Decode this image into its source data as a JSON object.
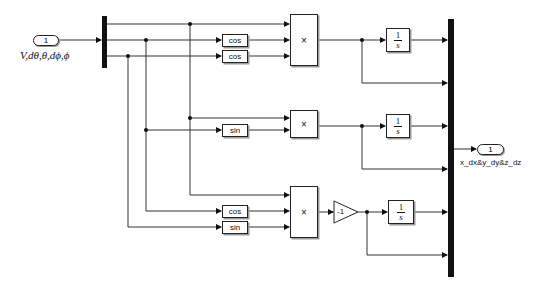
{
  "diagram": {
    "type": "simulink_subsystem",
    "inport": {
      "number": "1",
      "label": "V,dθ,θ,dϕ,ϕ"
    },
    "outport": {
      "number": "1",
      "label": "x_dx&y_dy&z_dz"
    },
    "demux": {
      "outputs": 3
    },
    "mux": {
      "inputs": 6
    },
    "functions": [
      {
        "id": "cos1",
        "label": "cos"
      },
      {
        "id": "cos2",
        "label": "cos"
      },
      {
        "id": "sin1",
        "label": "sin"
      },
      {
        "id": "cos3",
        "label": "cos"
      },
      {
        "id": "sin2",
        "label": "sin"
      }
    ],
    "products": [
      {
        "id": "prod1",
        "label": "×"
      },
      {
        "id": "prod2",
        "label": "×"
      },
      {
        "id": "prod3",
        "label": "×"
      }
    ],
    "gain": {
      "label": "-1"
    },
    "integrators": [
      {
        "id": "int1",
        "num": "1",
        "den": "s"
      },
      {
        "id": "int2",
        "num": "1",
        "den": "s"
      },
      {
        "id": "int3",
        "num": "1",
        "den": "s"
      }
    ]
  }
}
